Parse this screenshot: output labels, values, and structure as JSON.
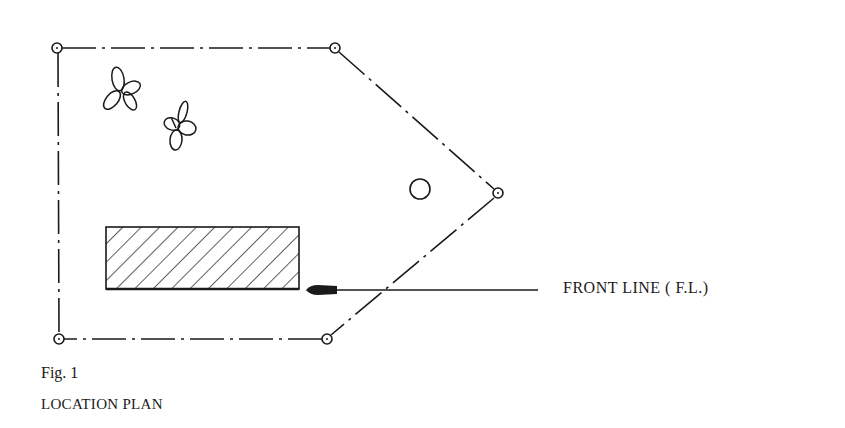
{
  "diagram": {
    "type": "location-plan",
    "boundary": {
      "style": "dash-dot",
      "corners": [
        {
          "id": "top-left",
          "x": 57,
          "y": 48
        },
        {
          "id": "top-right",
          "x": 335,
          "y": 48
        },
        {
          "id": "right",
          "x": 498,
          "y": 193
        },
        {
          "id": "bottom-right",
          "x": 327,
          "y": 339
        },
        {
          "id": "bottom-left",
          "x": 59,
          "y": 339
        }
      ]
    },
    "building": {
      "x": 106,
      "y": 227,
      "width": 193,
      "height": 62,
      "fill": "hatched"
    },
    "tree_circle": {
      "cx": 420,
      "cy": 189,
      "r": 10
    },
    "flowers": [
      {
        "cx": 122,
        "cy": 92
      },
      {
        "cx": 178,
        "cy": 126
      }
    ],
    "arrow": {
      "from_x": 538,
      "to_x": 306,
      "y": 290
    }
  },
  "labels": {
    "front_line": "FRONT LINE  ( F.L.)",
    "figure_number": "Fig. 1",
    "figure_title": "LOCATION PLAN"
  }
}
